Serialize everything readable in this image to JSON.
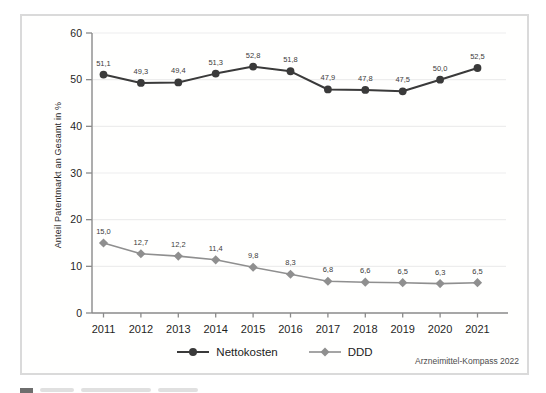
{
  "figure": {
    "source_note": "Arzneimittel-Kompass 2022"
  },
  "chart_data": {
    "type": "line",
    "title": "",
    "xlabel": "",
    "ylabel": "Anteil Patentmarkt an Gesamt in %",
    "x_categories": [
      "2011",
      "2012",
      "2013",
      "2014",
      "2015",
      "2016",
      "2017",
      "2018",
      "2019",
      "2020",
      "2021"
    ],
    "ylim": [
      0,
      60
    ],
    "yticks": [
      0,
      10,
      20,
      30,
      40,
      50,
      60
    ],
    "grid": "horizontal-light",
    "legend_position": "bottom",
    "series": [
      {
        "name": "Nettokosten",
        "marker": "circle",
        "color": "#3a3a3a",
        "values": [
          51.1,
          49.3,
          49.4,
          51.3,
          52.8,
          51.8,
          47.9,
          47.8,
          47.5,
          50.0,
          52.5
        ],
        "labels": [
          "51,1",
          "49,3",
          "49,4",
          "51,3",
          "52,8",
          "51,8",
          "47,9",
          "47,8",
          "47,5",
          "50,0",
          "52,5"
        ]
      },
      {
        "name": "DDD",
        "marker": "diamond",
        "color": "#8f8f8f",
        "values": [
          15.0,
          12.7,
          12.2,
          11.4,
          9.8,
          8.3,
          6.8,
          6.6,
          6.5,
          6.3,
          6.5
        ],
        "labels": [
          "15,0",
          "12,7",
          "12,2",
          "11,4",
          "9,8",
          "8,3",
          "6,8",
          "6,6",
          "6,5",
          "6,3",
          "6,5"
        ]
      }
    ]
  }
}
